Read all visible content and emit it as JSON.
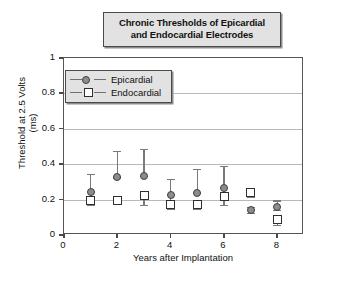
{
  "title": {
    "line1": "Chronic Thresholds of Epicardial",
    "line2": "and Endocardial Electrodes"
  },
  "axes": {
    "xlabel": "Years after Implantation",
    "ylabel_line1": "Threshold at 2.5 Volts",
    "ylabel_line2": "(ms)",
    "xticks": [
      "0",
      "2",
      "4",
      "6",
      "8"
    ],
    "yticks": [
      "0",
      "0.2",
      "0.4",
      "0.6",
      "0.8",
      "1"
    ]
  },
  "legend": {
    "items": [
      {
        "label": "Epicardial",
        "marker": "circle-marker"
      },
      {
        "label": "Endocardial",
        "marker": "square-marker"
      }
    ]
  },
  "colors": {
    "epicardial_marker_fill": "#8c8c8c",
    "epicardial_marker_edge": "#3f3f3f",
    "endocardial_marker_fill": "#ffffff",
    "endocardial_marker_edge": "#2f2f2f",
    "errorbar": "#7a7a7a",
    "gridline": "#b9b9b9",
    "axis": "#555555",
    "panel_fill": "#e2e2e2"
  },
  "chart_data": {
    "type": "scatter",
    "title": "Chronic Thresholds of Epicardial and Endocardial Electrodes",
    "xlabel": "Years after Implantation",
    "ylabel": "Threshold at 2.5 Volts (ms)",
    "xlim": [
      0,
      9
    ],
    "ylim": [
      0,
      1
    ],
    "xticks": [
      0,
      2,
      4,
      6,
      8
    ],
    "yticks": [
      0,
      0.2,
      0.4,
      0.6,
      0.8,
      1
    ],
    "grid": "horizontal",
    "legend_position": "upper-left-inside",
    "errorbars": "asymmetric-vertical",
    "series": [
      {
        "name": "Epicardial",
        "marker": "circle",
        "x": [
          1,
          2,
          3,
          4,
          5,
          6,
          7,
          8
        ],
        "values": [
          0.245,
          0.325,
          0.335,
          0.225,
          0.24,
          0.265,
          0.142,
          0.16
        ],
        "err_upper": [
          0.345,
          0.475,
          0.485,
          0.315,
          0.375,
          0.39,
          0.16,
          0.195
        ],
        "err_lower": [
          0.195,
          0.325,
          0.335,
          0.18,
          0.24,
          0.265,
          0.125,
          0.14
        ]
      },
      {
        "name": "Endocardial",
        "marker": "square",
        "x": [
          1,
          2,
          3,
          4,
          5,
          6,
          7,
          8
        ],
        "values": [
          0.195,
          0.195,
          0.222,
          0.172,
          0.17,
          0.218,
          0.242,
          0.088
        ],
        "err_upper": [
          0.215,
          0.21,
          0.245,
          0.195,
          0.195,
          0.245,
          0.268,
          0.115
        ],
        "err_lower": [
          0.168,
          0.182,
          0.172,
          0.148,
          0.145,
          0.172,
          0.215,
          0.055
        ]
      }
    ]
  }
}
